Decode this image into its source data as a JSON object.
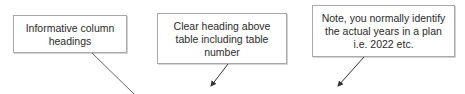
{
  "callouts": [
    {
      "id": "column-headings",
      "text": "Informative column\nheadings"
    },
    {
      "id": "table-heading",
      "text": "Clear heading above\ntable including table\nnumber"
    },
    {
      "id": "years-note",
      "text": "Note, you normally identify\nthe actual years in a plan\ni.e. 2022 etc."
    }
  ],
  "colors": {
    "border": "#a8a8a8",
    "text": "#2a2a2a",
    "arrow": "#333333"
  }
}
